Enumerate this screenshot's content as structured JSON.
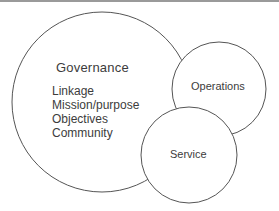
{
  "diagram": {
    "type": "overlapping-circles",
    "circles": [
      {
        "id": "governance",
        "title": "Governance",
        "items": [
          "Linkage",
          "Mission/purpose",
          "Objectives",
          "Community"
        ],
        "cx": 102,
        "cy": 102,
        "r": 90
      },
      {
        "id": "operations",
        "title": "Operations",
        "cx": 219,
        "cy": 89,
        "r": 47
      },
      {
        "id": "service",
        "title": "Service",
        "cx": 189,
        "cy": 155,
        "r": 48
      }
    ],
    "colors": {
      "stroke": "#555555",
      "fill": "#ffffff",
      "text": "#3c3c3c",
      "top_rule": "#9a9a9a"
    }
  }
}
